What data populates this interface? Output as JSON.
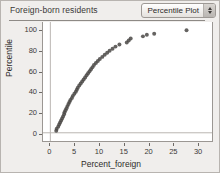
{
  "window": {
    "title": "Foreign-born residents",
    "background_color": "#f0eeec"
  },
  "plot_menu": {
    "label": "Percentile Plot",
    "stepper_up_icon": "triangle-up-icon",
    "stepper_down_icon": "triangle-down-icon"
  },
  "chart_data": {
    "type": "scatter",
    "title": "Foreign-born residents",
    "xlabel": "Percent_foreign",
    "ylabel": "Percentile",
    "xlim": [
      -1.5,
      33
    ],
    "ylim": [
      -8,
      108
    ],
    "xticks": [
      0,
      5,
      10,
      15,
      20,
      25,
      30
    ],
    "xtick_labels": [
      "0",
      "5",
      "10",
      "15",
      "20",
      "25",
      "30"
    ],
    "yticks": [
      0,
      20,
      40,
      60,
      80,
      100
    ],
    "ytick_labels": [
      "0",
      "20",
      "40",
      "60",
      "80",
      "100"
    ],
    "grid": false,
    "reference_lines": {
      "x": 0,
      "y": 0
    },
    "marker": {
      "shape": "circle",
      "radius": 2.0,
      "color": "#4a4845",
      "opacity": 0.85
    },
    "legend": null,
    "points": [
      [
        1.2,
        2.0
      ],
      [
        1.3,
        4.0
      ],
      [
        1.6,
        6.0
      ],
      [
        1.8,
        8.0
      ],
      [
        2.0,
        10.0
      ],
      [
        2.2,
        12.0
      ],
      [
        2.4,
        14.0
      ],
      [
        2.6,
        16.0
      ],
      [
        2.8,
        18.0
      ],
      [
        2.9,
        20.0
      ],
      [
        3.1,
        22.0
      ],
      [
        3.3,
        24.0
      ],
      [
        3.5,
        26.0
      ],
      [
        3.7,
        28.0
      ],
      [
        3.9,
        30.0
      ],
      [
        4.1,
        32.0
      ],
      [
        4.4,
        34.0
      ],
      [
        4.6,
        36.0
      ],
      [
        4.9,
        38.0
      ],
      [
        5.2,
        40.0
      ],
      [
        5.4,
        42.0
      ],
      [
        5.6,
        44.0
      ],
      [
        5.9,
        46.0
      ],
      [
        6.2,
        48.0
      ],
      [
        6.5,
        50.0
      ],
      [
        6.8,
        52.0
      ],
      [
        7.1,
        54.0
      ],
      [
        7.4,
        56.0
      ],
      [
        7.7,
        58.0
      ],
      [
        8.0,
        60.0
      ],
      [
        8.3,
        62.0
      ],
      [
        8.6,
        64.0
      ],
      [
        8.9,
        66.0
      ],
      [
        9.3,
        68.0
      ],
      [
        9.7,
        70.0
      ],
      [
        10.1,
        72.0
      ],
      [
        10.6,
        74.0
      ],
      [
        11.1,
        76.0
      ],
      [
        11.6,
        78.0
      ],
      [
        12.1,
        80.0
      ],
      [
        12.7,
        82.0
      ],
      [
        13.3,
        84.0
      ],
      [
        14.1,
        86.0
      ],
      [
        15.6,
        88.0
      ],
      [
        16.0,
        90.0
      ],
      [
        16.4,
        92.0
      ],
      [
        18.9,
        94.0
      ],
      [
        19.7,
        95.5
      ],
      [
        21.2,
        96.5
      ],
      [
        27.8,
        100.0
      ]
    ]
  }
}
